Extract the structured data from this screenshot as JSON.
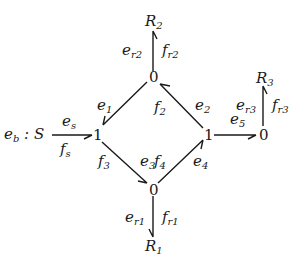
{
  "diagram": {
    "type": "bond-graph",
    "nodes": [
      {
        "id": "S",
        "label": "e",
        "sub": "b",
        "suffix": " : S",
        "kind": "source"
      },
      {
        "id": "J1L",
        "label": "1",
        "kind": "1-junction"
      },
      {
        "id": "J0T",
        "label": "0",
        "kind": "0-junction"
      },
      {
        "id": "J1R",
        "label": "1",
        "kind": "1-junction"
      },
      {
        "id": "J0B",
        "label": "0",
        "kind": "0-junction"
      },
      {
        "id": "J0R",
        "label": "0",
        "kind": "0-junction"
      },
      {
        "id": "R1",
        "label": "R",
        "sub": "1",
        "kind": "resistor"
      },
      {
        "id": "R2",
        "label": "R",
        "sub": "2",
        "kind": "resistor"
      },
      {
        "id": "R3",
        "label": "R",
        "sub": "3",
        "kind": "resistor"
      }
    ],
    "bonds": [
      {
        "from": "S",
        "to": "J1L",
        "effort": {
          "b": "e",
          "s": "s"
        },
        "flow": {
          "b": "f",
          "s": "s"
        }
      },
      {
        "from": "J0T",
        "to": "J1L",
        "effort": {
          "b": "e",
          "s": "1"
        },
        "flow": null
      },
      {
        "from": "J1R",
        "to": "J0T",
        "effort": {
          "b": "e",
          "s": "2"
        },
        "flow": {
          "b": "f",
          "s": "2"
        }
      },
      {
        "from": "J0T",
        "to": "R2",
        "effort": {
          "b": "e",
          "s": "r2"
        },
        "flow": {
          "b": "f",
          "s": "r2"
        }
      },
      {
        "from": "J1L",
        "to": "J0B",
        "effort": {
          "b": "e",
          "s": "3"
        },
        "flow": {
          "b": "f",
          "s": "3"
        }
      },
      {
        "from": "J0B",
        "to": "J1R",
        "effort": {
          "b": "e",
          "s": "4"
        },
        "flow": {
          "b": "f",
          "s": "4"
        }
      },
      {
        "from": "J0B",
        "to": "R1",
        "effort": {
          "b": "e",
          "s": "r1"
        },
        "flow": {
          "b": "f",
          "s": "r1"
        }
      },
      {
        "from": "J1R",
        "to": "J0R",
        "effort": {
          "b": "e",
          "s": "5"
        },
        "flow": null
      },
      {
        "from": "J0R",
        "to": "R3",
        "effort": {
          "b": "e",
          "s": "r3"
        },
        "flow": {
          "b": "f",
          "s": "r3"
        }
      }
    ]
  }
}
